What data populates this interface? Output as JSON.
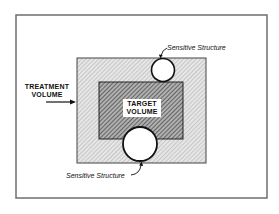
{
  "diagram": {
    "treatment_volume_label_line1": "TREATMENT",
    "treatment_volume_label_line2": "VOLUME",
    "target_volume_label_line1": "TARGET",
    "target_volume_label_line2": "VOLUME",
    "sensitive_structure_top_label": "Sensitive Structure",
    "sensitive_structure_bottom_label": "Sensitive Structure"
  },
  "colors": {
    "frame": "#6e6e6e",
    "treatment_fill": "#d4d4d4",
    "target_fill": "#8a8a8a",
    "outline": "#222222",
    "circle_fill": "#ffffff"
  }
}
